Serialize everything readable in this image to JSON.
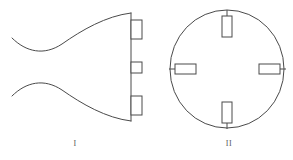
{
  "page": {
    "background_color": "#ffffff",
    "stroke_color": "#4a4a4a",
    "fill_color": "#ffffff",
    "text_color": "#5a5a5a",
    "width": 293,
    "height": 160
  },
  "figures": [
    {
      "id": "figure-1",
      "label": "I",
      "kind": "flared-horn-profile-view",
      "description": "Profile (side) view of a flared horn-shaped body closed by a straight vertical right edge, carrying three rectangular mounting tabs",
      "tabs": [
        {
          "name": "tab-top",
          "position": "top",
          "orientation": "vertical"
        },
        {
          "name": "tab-middle",
          "position": "middle",
          "orientation": "vertical"
        },
        {
          "name": "tab-bottom",
          "position": "bottom",
          "orientation": "vertical"
        }
      ],
      "tab_count": 3
    },
    {
      "id": "figure-2",
      "label": "II",
      "kind": "circular-front-view",
      "description": "Front (end) view showing a circular outline with four rectangular mounting tabs at top, bottom, left and right",
      "tabs": [
        {
          "name": "tab-top",
          "position": "top",
          "orientation": "vertical"
        },
        {
          "name": "tab-right",
          "position": "right",
          "orientation": "horizontal"
        },
        {
          "name": "tab-bottom",
          "position": "bottom",
          "orientation": "vertical"
        },
        {
          "name": "tab-left",
          "position": "left",
          "orientation": "horizontal"
        }
      ],
      "tab_count": 4
    }
  ],
  "geometry": {
    "figure1": {
      "upper_curve": "M 12,38 C 26,52 44,56 62,44 C 82,30 106,16 131,13",
      "lower_curve": "M 12,96 C 26,82 44,78 62,90 C 82,104 106,118 131,121",
      "right_edge": {
        "x": 131,
        "y1": 13,
        "y2": 121
      },
      "tabs": [
        {
          "x": 131,
          "y": 20,
          "w": 11,
          "h": 19
        },
        {
          "x": 131,
          "y": 62,
          "w": 11,
          "h": 11
        },
        {
          "x": 131,
          "y": 96,
          "w": 11,
          "h": 19
        }
      ]
    },
    "figure2": {
      "circle": {
        "cx": 227,
        "cy": 69,
        "rx": 57,
        "ry": 59
      },
      "tabs": [
        {
          "name": "tab-top",
          "x": 222,
          "y": 16,
          "w": 10,
          "h": 21,
          "stem": {
            "x1": 227,
            "y1": 10,
            "x2": 227,
            "y2": 16
          }
        },
        {
          "name": "tab-bottom",
          "x": 222,
          "y": 102,
          "w": 10,
          "h": 21,
          "stem": {
            "x1": 227,
            "y1": 123,
            "x2": 227,
            "y2": 129
          }
        },
        {
          "name": "tab-left",
          "x": 175,
          "y": 64,
          "w": 21,
          "h": 10,
          "stem": {
            "x1": 169,
            "y1": 69,
            "x2": 175,
            "y2": 69
          }
        },
        {
          "name": "tab-right",
          "x": 259,
          "y": 64,
          "w": 21,
          "h": 10,
          "stem": {
            "x1": 280,
            "y1": 69,
            "x2": 286,
            "y2": 69
          }
        }
      ]
    }
  }
}
